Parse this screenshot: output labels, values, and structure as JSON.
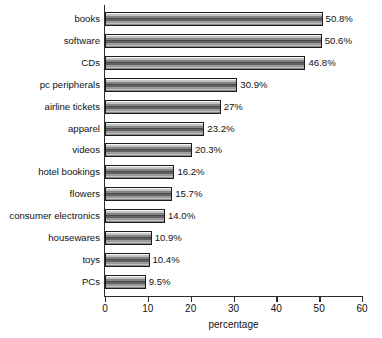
{
  "chart_data": {
    "type": "bar",
    "orientation": "horizontal",
    "title": "",
    "xlabel": "percentage",
    "ylabel": "",
    "xlim": [
      0,
      60
    ],
    "xticks": [
      0,
      10,
      20,
      30,
      40,
      50,
      60
    ],
    "grid": false,
    "legend": null,
    "categories": [
      "books",
      "software",
      "CDs",
      "pc peripherals",
      "airline tickets",
      "apparel",
      "videos",
      "hotel bookings",
      "flowers",
      "consumer electronics",
      "housewares",
      "toys",
      "PCs"
    ],
    "values": [
      50.8,
      50.6,
      46.8,
      30.9,
      27,
      23.2,
      20.3,
      16.2,
      15.7,
      14.0,
      10.9,
      10.4,
      9.5
    ],
    "value_labels": [
      "50.8%",
      "50.6%",
      "46.8%",
      "30.9%",
      "27%",
      "23.2%",
      "20.3%",
      "16.2%",
      "15.7%",
      "14.0%",
      "10.9%",
      "10.4%",
      "9.5%"
    ],
    "colors": {
      "bar_fill_light": "#ffffff",
      "bar_fill_dark": "#3d3d3d",
      "bar_border": "#1c1c1c",
      "axis": "#2b2b2b",
      "text": "#111111",
      "background": "#ffffff"
    }
  }
}
